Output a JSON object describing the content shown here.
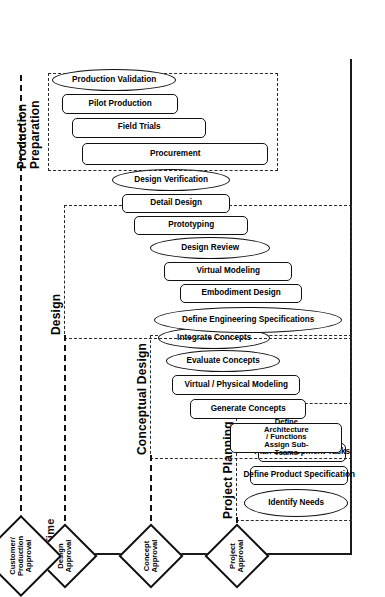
{
  "diagram": {
    "axis": {
      "label": "Time",
      "direction": "up",
      "arrow_icon": "arrow-up-icon"
    },
    "orientation_note": "page rotated 90 degrees"
  },
  "phases": [
    {
      "id": "project-planning",
      "label": "Project Planning",
      "tasks": [
        {
          "label": "Identify Needs",
          "shape": "oval"
        },
        {
          "label": "Define Product Specification",
          "shape": "rounded-rect"
        },
        {
          "label": "Plan Development Tasks",
          "shape": "rounded-rect"
        }
      ]
    },
    {
      "id": "conceptual-design",
      "label": "Conceptual Design",
      "tasks": [
        {
          "label": "Define Architecture / Functions\nAssign Sub-Teams",
          "shape": "rounded-rect"
        },
        {
          "label": "Generate Concepts",
          "shape": "rounded-rect"
        },
        {
          "label": "Virtual / Physical Modeling",
          "shape": "rounded-rect"
        },
        {
          "label": "Evaluate Concepts",
          "shape": "oval"
        },
        {
          "label": "Integrate Concepts",
          "shape": "oval"
        }
      ]
    },
    {
      "id": "design",
      "label": "Design",
      "tasks": [
        {
          "label": "Define Engineering Specifications",
          "shape": "oval"
        },
        {
          "label": "Embodiment Design",
          "shape": "rounded-rect"
        },
        {
          "label": "Virtual Modeling",
          "shape": "rounded-rect"
        },
        {
          "label": "Design Review",
          "shape": "oval"
        },
        {
          "label": "Prototyping",
          "shape": "rounded-rect"
        },
        {
          "label": "Detail Design",
          "shape": "rounded-rect"
        },
        {
          "label": "Design Verification",
          "shape": "oval"
        }
      ]
    },
    {
      "id": "production-preparation",
      "label": "Production\nPreparation",
      "tasks": [
        {
          "label": "Procurement",
          "shape": "rounded-rect"
        },
        {
          "label": "Field Trials",
          "shape": "rounded-rect"
        },
        {
          "label": "Pilot Production",
          "shape": "rounded-rect"
        },
        {
          "label": "Production Validation",
          "shape": "oval"
        }
      ]
    }
  ],
  "milestones": [
    {
      "id": "project-approval",
      "label": "Project\nApproval"
    },
    {
      "id": "concept-approval",
      "label": "Concept\nApproval"
    },
    {
      "id": "design-approval",
      "label": "Design\nApproval"
    },
    {
      "id": "customer-production-approval",
      "label": "Customer/\nProduction\nApproval"
    }
  ]
}
